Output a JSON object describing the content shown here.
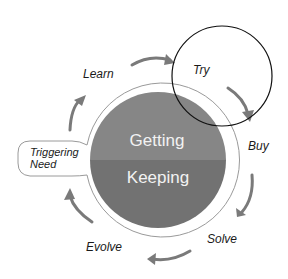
{
  "diagram": {
    "center": {
      "top_label": "Getting",
      "bottom_label": "Keeping",
      "top_color": "#868686",
      "bottom_color": "#727272",
      "ring_color": "#9a9a9a"
    },
    "cycle_stages": [
      {
        "id": "learn",
        "label": "Learn"
      },
      {
        "id": "try",
        "label": "Try",
        "highlighted": true
      },
      {
        "id": "buy",
        "label": "Buy"
      },
      {
        "id": "solve",
        "label": "Solve"
      },
      {
        "id": "evolve",
        "label": "Evolve"
      }
    ],
    "entry_point": {
      "line1": "Triggering",
      "line2": "Need"
    },
    "arrow_color": "#7a7a7a",
    "highlight_circle_color": "#111111"
  }
}
